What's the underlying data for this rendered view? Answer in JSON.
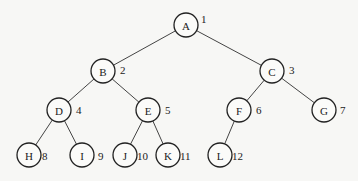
{
  "diagram": {
    "type": "binary-tree",
    "nodes": [
      {
        "id": "A",
        "label": "A",
        "index": "1",
        "x": 186,
        "y": 25
      },
      {
        "id": "B",
        "label": "B",
        "index": "2",
        "x": 103,
        "y": 71
      },
      {
        "id": "C",
        "label": "C",
        "index": "3",
        "x": 272,
        "y": 71
      },
      {
        "id": "D",
        "label": "D",
        "index": "4",
        "x": 59,
        "y": 110
      },
      {
        "id": "E",
        "label": "E",
        "index": "5",
        "x": 148,
        "y": 110
      },
      {
        "id": "F",
        "label": "F",
        "index": "6",
        "x": 239,
        "y": 110
      },
      {
        "id": "G",
        "label": "G",
        "index": "7",
        "x": 324,
        "y": 110
      },
      {
        "id": "H",
        "label": "H",
        "index": "8",
        "x": 29,
        "y": 155
      },
      {
        "id": "I",
        "label": "I",
        "index": "9",
        "x": 82,
        "y": 155
      },
      {
        "id": "J",
        "label": "J",
        "index": "10",
        "x": 125,
        "y": 155
      },
      {
        "id": "K",
        "label": "K",
        "index": "11",
        "x": 168,
        "y": 155
      },
      {
        "id": "L",
        "label": "L",
        "index": "12",
        "x": 220,
        "y": 155
      }
    ],
    "edges": [
      [
        "A",
        "B"
      ],
      [
        "A",
        "C"
      ],
      [
        "B",
        "D"
      ],
      [
        "B",
        "E"
      ],
      [
        "C",
        "F"
      ],
      [
        "C",
        "G"
      ],
      [
        "D",
        "H"
      ],
      [
        "D",
        "I"
      ],
      [
        "E",
        "J"
      ],
      [
        "E",
        "K"
      ],
      [
        "F",
        "L"
      ]
    ],
    "index_offsets": {
      "A": [
        15,
        -9
      ],
      "B": [
        17,
        -4
      ],
      "C": [
        17,
        -4
      ],
      "D": [
        17,
        -3
      ],
      "E": [
        17,
        -3
      ],
      "F": [
        17,
        -3
      ],
      "G": [
        16,
        -3
      ],
      "H": [
        13,
        -2
      ],
      "I": [
        16,
        -2
      ],
      "J": [
        12,
        -2
      ],
      "K": [
        12,
        -2
      ],
      "L": [
        12,
        -2
      ]
    },
    "radius": 12
  }
}
